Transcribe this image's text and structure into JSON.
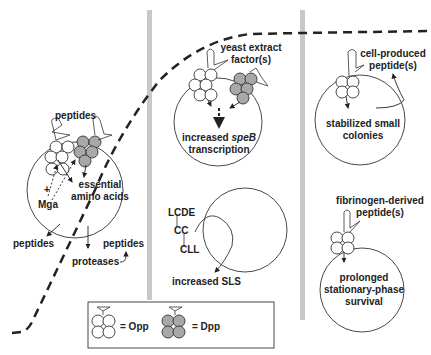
{
  "colors": {
    "divider": "#c8c8c8",
    "stroke": "#222222",
    "opp_fill": "#ffffff",
    "dpp_fill": "#a8a8a8",
    "background": "#ffffff"
  },
  "panel_left": {
    "peptides_top": "peptides",
    "essential_line1": "essential",
    "essential_line2": "amino acids",
    "plus": "+",
    "mga": "Mga",
    "peptides_out_left": "peptides",
    "proteases": "proteases",
    "peptides_out_right": "peptides"
  },
  "panel_middle": {
    "yeast_line1": "yeast extract",
    "yeast_line2": "factor(s)",
    "speb_prefix": "increased ",
    "speb_gene": "speB",
    "speb_line2": "transcription",
    "lcde": "LCDE",
    "cc": "CC",
    "cll": "CLL",
    "sls": "increased SLS"
  },
  "panel_right": {
    "cell_line1": "cell-produced",
    "cell_line2": "peptide(s)",
    "stab_line1": "stabilized small",
    "stab_line2": "colonies",
    "fib_line1": "fibrinogen-derived",
    "fib_line2": "peptide(s)",
    "surv_line1": "prolonged",
    "surv_line2": "stationary-phase",
    "surv_line3": "survival"
  },
  "legend": {
    "opp_label": "= Opp",
    "dpp_label": "= Dpp"
  }
}
